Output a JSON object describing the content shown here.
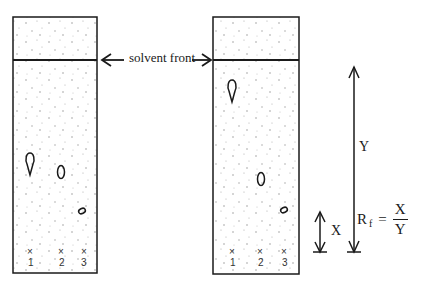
{
  "diagram": {
    "solvent_front_label": "solvent front",
    "left_plate": {
      "lanes": [
        {
          "label": "1",
          "marker": "×"
        },
        {
          "label": "2",
          "marker": "×"
        },
        {
          "label": "3",
          "marker": "×"
        }
      ],
      "spots": [
        "teardrop (lane 1)",
        "oval (lane 2)",
        "small oval (lane 3)"
      ]
    },
    "right_plate": {
      "lanes": [
        {
          "label": "1",
          "marker": "×"
        },
        {
          "label": "2",
          "marker": "×"
        },
        {
          "label": "3",
          "marker": "×"
        }
      ],
      "spots": [
        "teardrop (lane 1)",
        "oval (lane 2)",
        "small oval (lane 3)"
      ]
    },
    "distance_labels": {
      "y": "Y",
      "x": "X"
    },
    "formula": {
      "lhs": "R",
      "lhs_sub": "f",
      "equals": "=",
      "numerator": "X",
      "denominator": "Y"
    },
    "colors": {
      "ink": "#1a1a1a",
      "dots": "#9a9a9a",
      "background": "#ffffff"
    }
  }
}
